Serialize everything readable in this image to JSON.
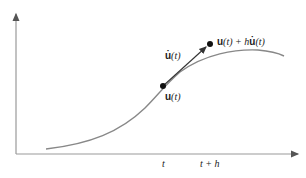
{
  "diagram": {
    "type": "euler-step-illustration",
    "axes": {
      "x_arrow": true,
      "y_arrow": true,
      "color": "#888888"
    },
    "curve": {
      "color": "#777777"
    },
    "tangent": {
      "color": "#333333"
    },
    "labels": {
      "point_u": {
        "bold": "u",
        "rest": "(t)"
      },
      "derivative": {
        "bold": "u̇",
        "rest": "(t)"
      },
      "next_point": {
        "bold1": "u",
        "mid": "(t) + h",
        "bold2": "u̇",
        "rest": "(t)"
      },
      "tick_t": "t",
      "tick_th": "t + h"
    }
  }
}
